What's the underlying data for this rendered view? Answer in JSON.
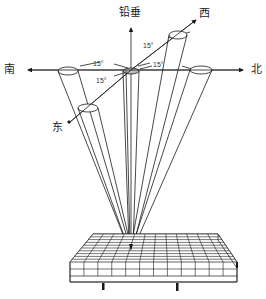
{
  "diagram": {
    "labels": {
      "vertical": "铅垂",
      "south": "南",
      "north": "北",
      "west": "西",
      "east": "东"
    },
    "angles": {
      "south": "15°",
      "east": "15°",
      "west": "15°",
      "north": "15°"
    },
    "colors": {
      "line": "#1a1a1a",
      "background": "#ffffff"
    },
    "grid": {
      "rows": 10,
      "cols": 12
    }
  }
}
